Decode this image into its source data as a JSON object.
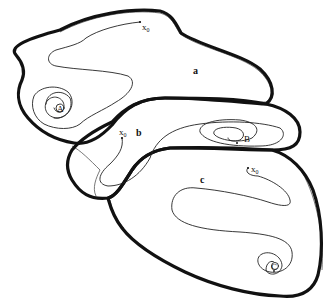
{
  "diagram": {
    "type": "basins-of-attraction",
    "basins": [
      {
        "id": "a",
        "label": "a",
        "attractor": "A",
        "start": "x0"
      },
      {
        "id": "b",
        "label": "b",
        "attractor": "B",
        "start": "x0"
      },
      {
        "id": "c",
        "label": "c",
        "attractor": "C",
        "start": "x0"
      }
    ],
    "labels": {
      "basin_a": "a",
      "basin_b": "b",
      "basin_c": "c",
      "attractor_a": "A",
      "attractor_b": "B",
      "attractor_c": "C",
      "start_a": "x",
      "start_b": "x",
      "start_c": "x",
      "start_sub": "0"
    },
    "colors": {
      "stroke": "#111111",
      "background": "#ffffff"
    }
  }
}
